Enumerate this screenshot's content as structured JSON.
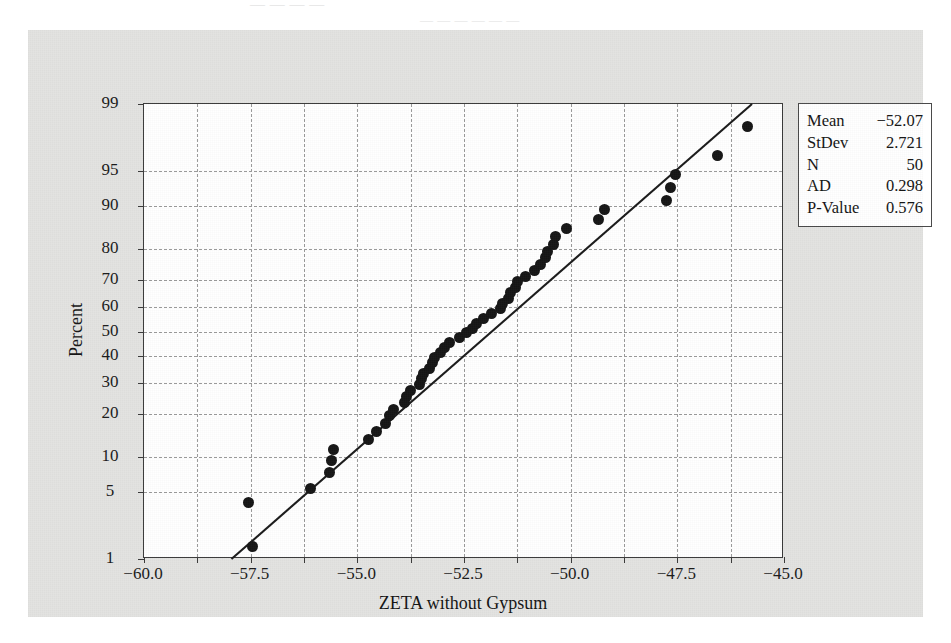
{
  "bleed_text": {
    "line1": "— —  — —",
    "line2": "— — —  — — —"
  },
  "legend": {
    "rows": [
      {
        "key": "Mean",
        "value": "−52.07"
      },
      {
        "key": "StDev",
        "value": "2.721"
      },
      {
        "key": "N",
        "value": "50"
      },
      {
        "key": "AD",
        "value": "0.298"
      },
      {
        "key": "P-Value",
        "value": "0.576"
      }
    ]
  },
  "chart_data": {
    "type": "scatter",
    "title": "",
    "xlabel": "ZETA without Gypsum",
    "ylabel": "Percent",
    "xlim": [
      -60.0,
      -45.0
    ],
    "xticks": [
      -60.0,
      -57.5,
      -55.0,
      -52.5,
      -50.0,
      -47.5,
      -45.0
    ],
    "xticklabels": [
      "−60.0",
      "−57.5",
      "−55.0",
      "−52.5",
      "−50.0",
      "−47.5",
      "−45.0"
    ],
    "x_minor_step": 1.25,
    "yscale": "normal-probability",
    "ylim": [
      1,
      99
    ],
    "yticks": [
      1,
      5,
      10,
      20,
      30,
      40,
      50,
      60,
      70,
      80,
      90,
      95,
      99
    ],
    "yticklabels": [
      "1",
      "5",
      "10",
      "20",
      "30",
      "40",
      "50",
      "60",
      "70",
      "80",
      "90",
      "95",
      "99"
    ],
    "grid": true,
    "grid_style": "dashed",
    "legend_position": "outside-right-top",
    "marker": "filled-circle",
    "marker_color": "#151515",
    "fit_line": {
      "label": "normal fit line",
      "color": "#1a1a1a",
      "x_start": -57.95,
      "y_start": 1.0,
      "x_end": -45.75,
      "y_end": 99.0
    },
    "stats": {
      "mean": -52.07,
      "stdev": 2.721,
      "n": 50,
      "ad": 0.298,
      "p_value": 0.576
    },
    "points": [
      {
        "x": -57.45,
        "percent": 1.4
      },
      {
        "x": -57.55,
        "percent": 4.0
      },
      {
        "x": -56.1,
        "percent": 5.4
      },
      {
        "x": -55.65,
        "percent": 7.5
      },
      {
        "x": -55.6,
        "percent": 9.4
      },
      {
        "x": -55.55,
        "percent": 11.4
      },
      {
        "x": -54.75,
        "percent": 13.4
      },
      {
        "x": -54.55,
        "percent": 15.4
      },
      {
        "x": -54.35,
        "percent": 17.4
      },
      {
        "x": -54.25,
        "percent": 19.4
      },
      {
        "x": -54.15,
        "percent": 21.4
      },
      {
        "x": -53.9,
        "percent": 23.4
      },
      {
        "x": -53.85,
        "percent": 25.4
      },
      {
        "x": -53.75,
        "percent": 27.4
      },
      {
        "x": -53.55,
        "percent": 29.4
      },
      {
        "x": -53.5,
        "percent": 31.4
      },
      {
        "x": -53.45,
        "percent": 33.4
      },
      {
        "x": -53.3,
        "percent": 35.4
      },
      {
        "x": -53.25,
        "percent": 37.4
      },
      {
        "x": -53.2,
        "percent": 39.4
      },
      {
        "x": -53.05,
        "percent": 41.4
      },
      {
        "x": -52.95,
        "percent": 43.4
      },
      {
        "x": -52.85,
        "percent": 45.4
      },
      {
        "x": -52.6,
        "percent": 47.4
      },
      {
        "x": -52.45,
        "percent": 49.4
      },
      {
        "x": -52.3,
        "percent": 51.4
      },
      {
        "x": -52.2,
        "percent": 53.4
      },
      {
        "x": -52.05,
        "percent": 55.4
      },
      {
        "x": -51.85,
        "percent": 57.4
      },
      {
        "x": -51.65,
        "percent": 59.4
      },
      {
        "x": -51.6,
        "percent": 61.4
      },
      {
        "x": -51.45,
        "percent": 63.4
      },
      {
        "x": -51.4,
        "percent": 65.4
      },
      {
        "x": -51.3,
        "percent": 67.4
      },
      {
        "x": -51.25,
        "percent": 69.4
      },
      {
        "x": -51.05,
        "percent": 71.4
      },
      {
        "x": -50.85,
        "percent": 73.4
      },
      {
        "x": -50.7,
        "percent": 75.4
      },
      {
        "x": -50.6,
        "percent": 77.4
      },
      {
        "x": -50.55,
        "percent": 79.4
      },
      {
        "x": -50.4,
        "percent": 81.4
      },
      {
        "x": -50.35,
        "percent": 83.4
      },
      {
        "x": -50.1,
        "percent": 85.4
      },
      {
        "x": -49.35,
        "percent": 87.4
      },
      {
        "x": -49.2,
        "percent": 89.4
      },
      {
        "x": -47.75,
        "percent": 91.0
      },
      {
        "x": -47.65,
        "percent": 93.0
      },
      {
        "x": -47.55,
        "percent": 94.6
      },
      {
        "x": -46.55,
        "percent": 96.4
      },
      {
        "x": -45.85,
        "percent": 98.2
      }
    ]
  }
}
